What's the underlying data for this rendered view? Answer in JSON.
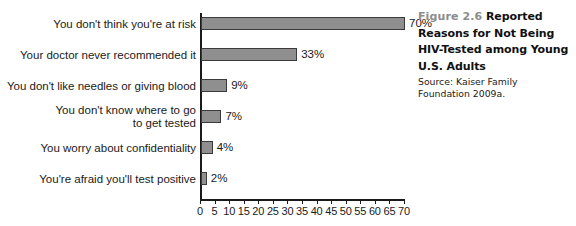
{
  "chart_data": {
    "type": "bar",
    "orientation": "horizontal",
    "title": "Reported Reasons for Not Being HIV-Tested among Young U.S. Adults",
    "xlabel": "",
    "ylabel": "",
    "xlim": [
      0,
      70
    ],
    "xticks": [
      0,
      5,
      10,
      15,
      20,
      25,
      30,
      35,
      40,
      45,
      50,
      55,
      60,
      65,
      70
    ],
    "xtick_labels": [
      "0",
      "5",
      "10",
      "15",
      "20",
      "25",
      "30",
      "35",
      "40",
      "45",
      "50",
      "55",
      "60",
      "65",
      "70"
    ],
    "grid": false,
    "legend": false,
    "bar_color": "#8f8f8f",
    "bar_edge_color": "#3a3a3a",
    "categories": [
      "You don't think you're at risk",
      "Your doctor never recommended it",
      "You don't like needles or giving blood",
      "You don't know where to go\nto get tested",
      "You worry about confidentiality",
      "You're afraid you'll test positive"
    ],
    "values": [
      70,
      33,
      9,
      7,
      4,
      2
    ],
    "data_labels": [
      "70%",
      "33%",
      "9%",
      "7%",
      "4%",
      "2%"
    ]
  },
  "caption": {
    "figure_number": "Figure 2.6",
    "title": "Reported Reasons for Not Being HIV-Tested among Young U.S. Adults",
    "source": "Source: Kaiser Family Foundation 2009a."
  }
}
